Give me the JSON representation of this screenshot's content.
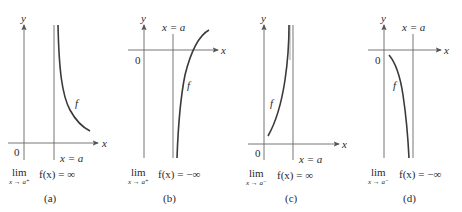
{
  "figure": {
    "panels": [
      {
        "id": "a",
        "caption": "(a)",
        "y_axis_label": "y",
        "x_axis_label": "x",
        "origin_label": "0",
        "asymptote_label": "x = a",
        "curve_label": "f",
        "limit_word": "lim",
        "limit_sub": "x → a⁺",
        "limit_expr": "f(x) = ∞",
        "description": "Curve decreases from +∞ just right of x = a"
      },
      {
        "id": "b",
        "caption": "(b)",
        "y_axis_label": "y",
        "x_axis_label": "x",
        "origin_label": "0",
        "asymptote_label": "x = a",
        "curve_label": "f",
        "limit_word": "lim",
        "limit_sub": "x → a⁺",
        "limit_expr": "f(x) = −∞",
        "description": "Curve goes to −∞ just right of x = a"
      },
      {
        "id": "c",
        "caption": "(c)",
        "y_axis_label": "y",
        "x_axis_label": "x",
        "origin_label": "0",
        "asymptote_label": "x = a",
        "curve_label": "f",
        "limit_word": "lim",
        "limit_sub": "x → a⁻",
        "limit_expr": "f(x) = ∞",
        "description": "Curve rises to +∞ just left of x = a"
      },
      {
        "id": "d",
        "caption": "(d)",
        "y_axis_label": "y",
        "x_axis_label": "x",
        "origin_label": "0",
        "asymptote_label": "x = a",
        "curve_label": "f",
        "limit_word": "lim",
        "limit_sub": "x → a⁻",
        "limit_expr": "f(x) = −∞",
        "description": "Curve falls to −∞ just left of x = a"
      }
    ],
    "colors": {
      "axis": "#555555",
      "curve": "#3a3a3a",
      "text": "#2a2a2a"
    }
  }
}
